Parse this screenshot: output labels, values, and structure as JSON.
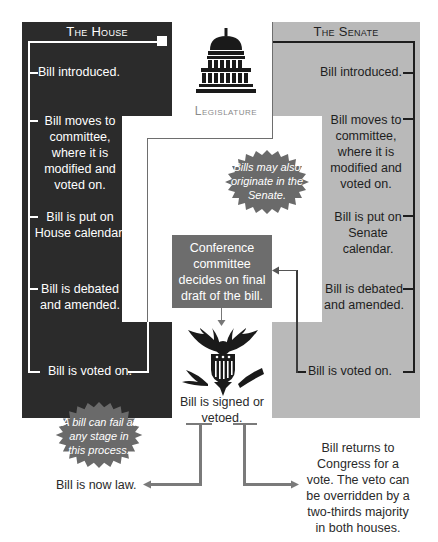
{
  "house": {
    "title": "The House",
    "steps": [
      "Bill introduced.",
      "Bill moves to committee, where it is modified and voted on.",
      "Bill is put on House calendar.",
      "Bill is debated and amended.",
      "Bill is voted on."
    ]
  },
  "senate": {
    "title": "The Senate",
    "steps": [
      "Bill introduced.",
      "Bill moves to committee, where it is modified and voted on.",
      "Bill is put on Senate calendar.",
      "Bill is debated and amended.",
      "Bill is voted on."
    ]
  },
  "legislature": {
    "label": "Legislature",
    "icon": "capitol-building-icon"
  },
  "notes": {
    "originate": "Bills may also originate in the Senate.",
    "fail": "A bill can fail at any stage in this process."
  },
  "conference": {
    "text": "Conference committee decides on final draft of the bill."
  },
  "president": {
    "icon": "presidential-eagle-seal-icon",
    "text": "Bill is signed or vetoed."
  },
  "outcomes": {
    "law": "Bill is now law.",
    "veto": "Bill returns to Congress for a vote. The veto can be overridden by a two-thirds majority in both houses."
  },
  "colors": {
    "house_panel": "#2b2b2b",
    "senate_panel": "#b9b9b9",
    "conference_box": "#6d6d6d",
    "starburst": "#6a6a6a",
    "connector": "#7a7a7a"
  }
}
